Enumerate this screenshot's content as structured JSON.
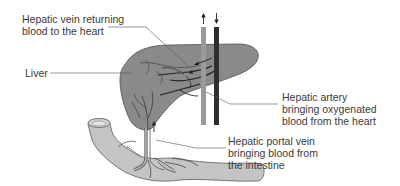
{
  "diagram": {
    "type": "anatomical-labeled-illustration",
    "colors": {
      "liver_fill": "#8a8a8a",
      "liver_outline": "#5a5a5a",
      "intestine_fill": "#c4c4c4",
      "intestine_outline": "#6a6a6a",
      "hepatic_vein_vessel": "#9a9a9a",
      "hepatic_artery_vessel": "#2e2e2e",
      "branch_dark": "#222222",
      "leader_line": "#555555",
      "text": "#3a3a3a"
    },
    "labels": {
      "hepatic_vein": {
        "line1": "Hepatic vein returning",
        "line2": "blood to the heart"
      },
      "liver": {
        "line1": "Liver"
      },
      "hepatic_artery": {
        "line1": "Hepatic artery",
        "line2": "bringing oxygenated",
        "line3": "blood from the heart"
      },
      "hepatic_portal_vein": {
        "line1": "Hepatic portal vein",
        "line2": "bringing blood from",
        "line3": "the intestine"
      }
    },
    "flow_arrows": [
      {
        "vessel": "hepatic-vein",
        "direction": "up"
      },
      {
        "vessel": "hepatic-artery",
        "direction": "down"
      },
      {
        "vessel": "hepatic-portal-vein",
        "direction": "up"
      }
    ]
  }
}
